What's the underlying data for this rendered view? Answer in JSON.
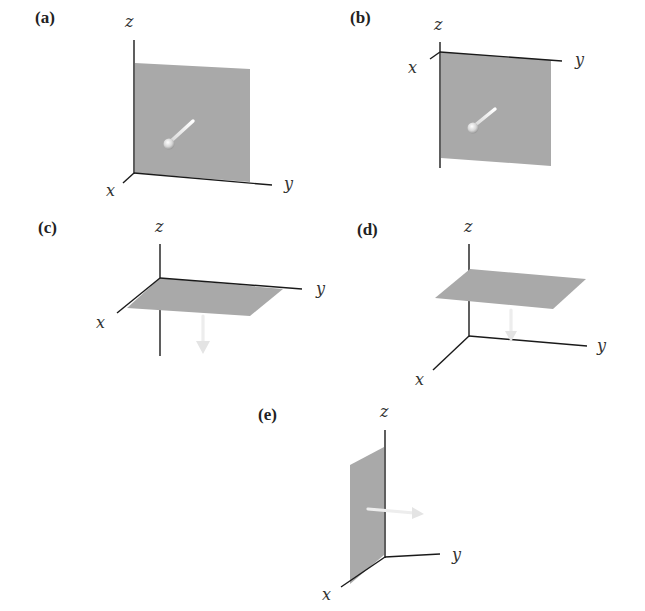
{
  "figure": {
    "colors": {
      "background": "#ffffff",
      "plane": "#a9a9a9",
      "axis": "#1a1a1a",
      "normal_vector": "#ededed"
    },
    "panels": [
      {
        "id": "a",
        "label": "(a)",
        "plane": "parallel to yz-plane",
        "normal_direction": "+x (toward viewer)",
        "axes": {
          "x": "x",
          "y": "y",
          "z": "z"
        }
      },
      {
        "id": "b",
        "label": "(b)",
        "plane": "parallel to yz-plane, below xy-plane",
        "normal_direction": "+x (toward viewer)",
        "axes": {
          "x": "x",
          "y": "y",
          "z": "z"
        }
      },
      {
        "id": "c",
        "label": "(c)",
        "plane": "in xy-plane",
        "normal_direction": "-z (down)",
        "axes": {
          "x": "x",
          "y": "y",
          "z": "z"
        }
      },
      {
        "id": "d",
        "label": "(d)",
        "plane": "parallel to xy-plane, above origin",
        "normal_direction": "-z (down)",
        "axes": {
          "x": "x",
          "y": "y",
          "z": "z"
        }
      },
      {
        "id": "e",
        "label": "(e)",
        "plane": "in xz-plane",
        "normal_direction": "+y (right)",
        "axes": {
          "x": "x",
          "y": "y",
          "z": "z"
        }
      }
    ]
  }
}
